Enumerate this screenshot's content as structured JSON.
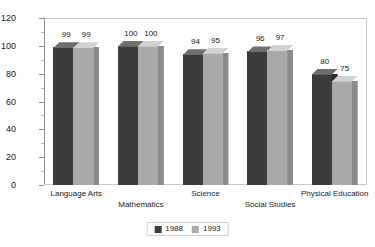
{
  "chart_data": {
    "type": "bar",
    "title": "",
    "subtitle": "",
    "xlabel": "",
    "ylabel": "",
    "ylim": [
      0,
      120
    ],
    "ytick_step": 20,
    "yticks": [
      0,
      20,
      40,
      60,
      80,
      100,
      120
    ],
    "ytick_labels": [
      "0",
      "20",
      "40",
      "60",
      "80",
      "100",
      "120"
    ],
    "grid": false,
    "legend_position": "bottom-center",
    "style": "3d-bar",
    "categories": [
      "Language Arts",
      "Mathematics",
      "Science",
      "Social Studies",
      "Physical Education"
    ],
    "series": [
      {
        "name": "1988",
        "color": "#3c3c3c",
        "values": [
          99,
          100,
          94,
          96,
          80
        ]
      },
      {
        "name": "1993",
        "color": "#a9a9a9",
        "values": [
          99,
          100,
          95,
          97,
          75
        ]
      }
    ],
    "data_labels": [
      [
        "99",
        "99"
      ],
      [
        "100",
        "100"
      ],
      [
        "94",
        "95"
      ],
      [
        "96",
        "97"
      ],
      [
        "80",
        "75"
      ]
    ]
  },
  "legend": {
    "entries": [
      {
        "label": "1988"
      },
      {
        "label": "1993"
      }
    ]
  },
  "colors": {
    "series_1988": "#3c3c3c",
    "series_1993": "#a9a9a9",
    "axis": "#8d8d8d",
    "frame": "#c9c9c9",
    "text": "#1a1a1a",
    "background": "#ffffff"
  }
}
